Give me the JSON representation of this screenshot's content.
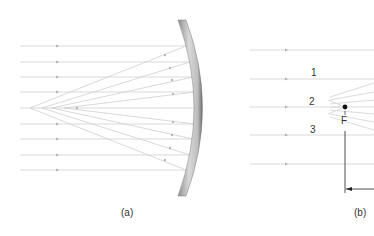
{
  "figure": {
    "panels": [
      {
        "id": "a",
        "caption": "(a)",
        "description": "Parallel rays reflecting from a spherical concave mirror converge near (not exactly at) a common point (spherical aberration)",
        "incident_ray_count": 9
      },
      {
        "id": "b",
        "caption": "(b)",
        "description": "Parallel rays reflecting toward focal point F",
        "ray_labels": [
          "1",
          "2",
          "3"
        ],
        "focal_point_label": "F",
        "incident_ray_count": 5
      }
    ]
  },
  "colors": {
    "ray": "#c8c8c8",
    "ray_arrow": "#a8a8a8",
    "mirror_light": "#e0e0e0",
    "mirror_dark": "#8a8a8a",
    "text": "#333333",
    "dimension_line": "#222222"
  }
}
